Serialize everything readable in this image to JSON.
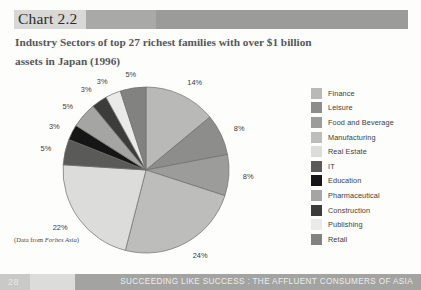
{
  "header": {
    "chart_label": "Chart 2.2",
    "title_line1": "Industry Sectors of top 27 richest families with over $1 billion",
    "title_line2": "assets in Japan (1996)"
  },
  "source_note_prefix": "(Data from ",
  "source_note_italic": "Forbes Asia",
  "source_note_suffix": ")",
  "footer": {
    "page_number": "28",
    "title": "SUCCEEDING LIKE SUCCESS : THE AFFLUENT CONSUMERS OF ASIA"
  },
  "colors": {
    "band_light": "#d8d8d6",
    "band_mid": "#a9a9a7",
    "band_dark": "#9b9b99",
    "footer_bar": "#a3a3a1",
    "title_text": "#55565a"
  },
  "chart_data": {
    "type": "pie",
    "title": "Industry Sectors of top 27 richest families with over $1 billion assets in Japan (1996)",
    "source": "Forbes Asia",
    "legend_position": "right",
    "units": "percent",
    "total": 100,
    "categories": [
      "Finance",
      "Leisure",
      "Food and Beverage",
      "Manufacturing",
      "Real Estate",
      "IT",
      "Education",
      "Pharmaceutical",
      "Construction",
      "Publishing",
      "Retail"
    ],
    "values": [
      14,
      8,
      8,
      24,
      22,
      5,
      3,
      5,
      3,
      3,
      5
    ],
    "labels": [
      "14%",
      "8%",
      "8%",
      "24%",
      "22%",
      "5%",
      "3%",
      "5%",
      "3%",
      "3%",
      "5%"
    ],
    "slice_colors": [
      "#b9b9b7",
      "#8d8d8b",
      "#9c9c9a",
      "#bdbdbb",
      "#dcdcda",
      "#5a5a58",
      "#161616",
      "#a5a5a3",
      "#3c3c3a",
      "#eaeae8",
      "#828280"
    ],
    "slices": [
      {
        "name": "Finance",
        "value": 14,
        "label": "14%",
        "color": "#b9b9b7"
      },
      {
        "name": "Leisure",
        "value": 8,
        "label": "8%",
        "color": "#8d8d8b"
      },
      {
        "name": "Food and Beverage",
        "value": 8,
        "label": "8%",
        "color": "#9c9c9a"
      },
      {
        "name": "Manufacturing",
        "value": 24,
        "label": "24%",
        "color": "#bdbdbb"
      },
      {
        "name": "Real Estate",
        "value": 22,
        "label": "22%",
        "color": "#dcdcda"
      },
      {
        "name": "IT",
        "value": 5,
        "label": "5%",
        "color": "#5a5a58"
      },
      {
        "name": "Education",
        "value": 3,
        "label": "3%",
        "color": "#161616"
      },
      {
        "name": "Pharmaceutical",
        "value": 5,
        "label": "5%",
        "color": "#a5a5a3"
      },
      {
        "name": "Construction",
        "value": 3,
        "label": "3%",
        "color": "#3c3c3a"
      },
      {
        "name": "Publishing",
        "value": 3,
        "label": "3%",
        "color": "#eaeae8"
      },
      {
        "name": "Retail",
        "value": 5,
        "label": "5%",
        "color": "#828280"
      }
    ]
  }
}
